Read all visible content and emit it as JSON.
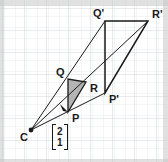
{
  "figure": {
    "width": 168,
    "height": 162,
    "background_color": "#ffffff",
    "grid": {
      "visible": true,
      "minor_color": "#e8eaec",
      "major_color": "#d2d6da",
      "minor_spacing": 11,
      "major_spacing": 22,
      "origin_x": 2,
      "origin_y": 8
    },
    "stroke_color": "#1a1a1a",
    "shade_color": "#b4b4b4",
    "points": [
      {
        "id": "C",
        "label": "C",
        "x": 31,
        "y": 130,
        "label_dx": -11,
        "label_dy": 3,
        "dot": true
      },
      {
        "id": "P",
        "label": "P",
        "x": 68,
        "y": 112,
        "label_dx": 4,
        "label_dy": 5,
        "dot": false
      },
      {
        "id": "Q",
        "label": "Q",
        "x": 68,
        "y": 79,
        "label_dx": -12,
        "label_dy": -9,
        "dot": false
      },
      {
        "id": "R",
        "label": "R",
        "x": 86,
        "y": 82,
        "label_dx": 4,
        "label_dy": 5,
        "dot": false
      },
      {
        "id": "P'",
        "label": "P'",
        "x": 105,
        "y": 93,
        "label_dx": 4,
        "label_dy": 5,
        "dot": false
      },
      {
        "id": "Q'",
        "label": "Q'",
        "x": 105,
        "y": 21,
        "label_dx": -12,
        "label_dy": -10,
        "dot": false
      },
      {
        "id": "R'",
        "label": "R'",
        "x": 148,
        "y": 21,
        "label_dx": 4,
        "label_dy": -9,
        "dot": false
      }
    ],
    "shaded_triangle": {
      "vertices": "P,Q,R",
      "fill": "#b4b4b4"
    },
    "rays": [
      {
        "from": "C",
        "to": "P'",
        "through": "P",
        "arrow_at": "P"
      },
      {
        "from": "C",
        "to": "Q'",
        "through": "Q",
        "arrow_at": "none"
      },
      {
        "from": "C",
        "to": "R'",
        "through": "R",
        "arrow_at": "none"
      }
    ],
    "triangles": [
      {
        "name": "PQR",
        "vertices": "P,Q,R"
      },
      {
        "name": "P'Q'R'",
        "vertices": "P',Q',R'"
      }
    ],
    "vector_label": {
      "notation": "column-vector",
      "top": "2",
      "bottom": "1"
    }
  }
}
